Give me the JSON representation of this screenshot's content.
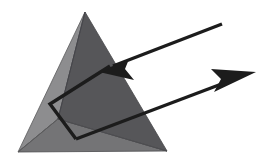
{
  "figure": {
    "background_color": "#ffffff",
    "width": 268,
    "height": 158
  },
  "prism": {
    "name": "triangular-prism",
    "shading": {
      "left_face_color": "#8d8d8f",
      "front_face_color": "#565659",
      "base_face_color": "#747476",
      "edge_color": "#4a4a4c",
      "edge_width": 0.8
    },
    "vertices": {
      "apex": [
        85,
        12
      ],
      "base_left": [
        18,
        152
      ],
      "base_right": [
        167,
        151
      ],
      "base_front": [
        58,
        119
      ]
    },
    "faces": [
      {
        "name": "left-face",
        "points": "85,12 18,152 58,119",
        "color": "#8d8d8f"
      },
      {
        "name": "front-face",
        "points": "85,12 58,119 167,151",
        "color": "#565659"
      },
      {
        "name": "base-face",
        "points": "18,152 58,119 167,151",
        "color": "#747476"
      }
    ]
  },
  "rays": {
    "stroke_color": "#1c1c1c",
    "stroke_width": 3.4,
    "incident": {
      "name": "incident-ray",
      "label": "incoming light ray",
      "tail": [
        222,
        24
      ],
      "tip": [
        99,
        72
      ],
      "arrow_head_points": "99,72 129,59 125,69 134,80"
    },
    "internal": {
      "name": "internal-ray",
      "label": "refracted ray inside prism",
      "points": "110,66 50,104 76,139"
    },
    "emergent": {
      "name": "emergent-ray",
      "label": "outgoing light ray",
      "tail": [
        76,
        139
      ],
      "tip": [
        256,
        72
      ],
      "arrow_head_points": "256,72 211,69 221,79 214,92"
    }
  }
}
